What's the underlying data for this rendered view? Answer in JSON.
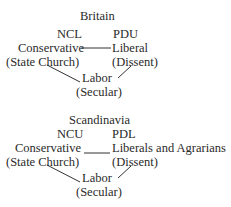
{
  "britain": {
    "title": "Britain",
    "left_code": "NCL",
    "right_code": "PDU",
    "left_party": "Conservative",
    "left_basis": "(State Church)",
    "right_party": "Liberal",
    "right_basis": "(Dissent)",
    "bottom_party": "Labor",
    "bottom_basis": "(Secular)"
  },
  "scandinavia": {
    "title": "Scandinavia",
    "left_code": "NCU",
    "right_code": "PDL",
    "left_party": "Conservative",
    "left_basis": "(State Church)",
    "right_party": "Liberals and Agrarians",
    "right_basis": "(Dissent)",
    "bottom_party": "Labor",
    "bottom_basis": "(Secular)"
  }
}
